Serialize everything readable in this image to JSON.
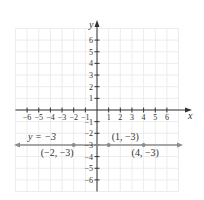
{
  "header": {
    "cut_text": "... y ... p(·,·) ..."
  },
  "chart_data": {
    "type": "line",
    "title": "",
    "xlabel": "x",
    "ylabel": "y",
    "xlim": [
      -6,
      6
    ],
    "ylim": [
      -6,
      6
    ],
    "grid": true,
    "x_ticks": [
      -6,
      -5,
      -4,
      -3,
      -2,
      -1,
      1,
      2,
      3,
      4,
      5,
      6
    ],
    "y_ticks": [
      -6,
      -5,
      -4,
      -3,
      -2,
      -1,
      1,
      2,
      3,
      4,
      5,
      6
    ],
    "x_tick_labels": [
      "−6",
      "−5",
      "−4",
      "−3",
      "−2",
      "−1",
      "1",
      "2",
      "3",
      "4",
      "5",
      "6"
    ],
    "y_tick_labels": [
      "−6",
      "−5",
      "−4",
      "−3",
      "−2",
      "−1",
      "1",
      "2",
      "3",
      "4",
      "5",
      "6"
    ],
    "series": [
      {
        "name": "y = −3",
        "equation": "y = -3",
        "type": "horizontal line",
        "y": -3
      }
    ],
    "points": [
      {
        "x": -2,
        "y": -3,
        "label": "(−2, −3)"
      },
      {
        "x": 1,
        "y": -3,
        "label": "(1, −3)"
      },
      {
        "x": 4,
        "y": -3,
        "label": "(4, −3)"
      }
    ],
    "annotations": [
      {
        "text": "y = −3",
        "near": [
          -5,
          -3
        ]
      }
    ],
    "colors": {
      "axis": "#333333",
      "line": "#8c8c8c",
      "grid": "#ececec",
      "points": "#8c8c8c"
    }
  }
}
